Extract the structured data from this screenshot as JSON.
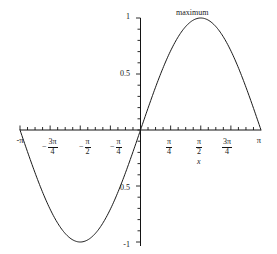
{
  "chart_data": {
    "type": "line",
    "title": "",
    "subtitle": "",
    "xlabel": "x",
    "ylabel": "",
    "function": "sin(x)",
    "xlim": [
      -3.14159265,
      3.14159265
    ],
    "ylim": [
      -1,
      1
    ],
    "grid": false,
    "legend": null,
    "x": [
      -3.14159265,
      -2.94524311,
      -2.74889357,
      -2.55254403,
      -2.35619449,
      -2.15984495,
      -1.96349541,
      -1.76714587,
      -1.57079633,
      -1.37444679,
      -1.17809725,
      -0.9817477,
      -0.78539816,
      -0.58904862,
      -0.39269908,
      -0.19634954,
      0,
      0.19634954,
      0.39269908,
      0.58904862,
      0.78539816,
      0.9817477,
      1.17809725,
      1.37444679,
      1.57079633,
      1.76714587,
      1.96349541,
      2.15984495,
      2.35619449,
      2.55254403,
      2.74889357,
      2.94524311,
      3.14159265
    ],
    "y": [
      0,
      -0.19509032,
      -0.38268343,
      -0.55557023,
      -0.70710678,
      -0.83146961,
      -0.92387953,
      -0.98078528,
      -1,
      -0.98078528,
      -0.92387953,
      -0.83146961,
      -0.70710678,
      -0.55557023,
      -0.38268343,
      -0.19509032,
      0,
      0.19509032,
      0.38268343,
      0.55557023,
      0.70710678,
      0.83146961,
      0.92387953,
      0.98078528,
      1,
      0.98078528,
      0.92387953,
      0.83146961,
      0.70710678,
      0.55557023,
      0.38268343,
      0.19509032,
      0
    ],
    "y_ticks": [
      {
        "value": 1,
        "label": "1"
      },
      {
        "value": 0.5,
        "label": "0.5"
      },
      {
        "value": -0.5,
        "label": "0.5"
      },
      {
        "value": -1,
        "label": "-1"
      }
    ],
    "x_ticks": [
      {
        "value": -3.14159265,
        "label": "-π",
        "kind": "plain",
        "sign": "-",
        "num": "",
        "den": ""
      },
      {
        "value": -2.35619449,
        "label": "-3π/4",
        "kind": "fraction",
        "sign": "-",
        "num": "3π",
        "den": "4"
      },
      {
        "value": -1.57079633,
        "label": "-π/2",
        "kind": "fraction",
        "sign": "-",
        "num": "π",
        "den": "2"
      },
      {
        "value": -0.78539816,
        "label": "-π/4",
        "kind": "fraction",
        "sign": "-",
        "num": "π",
        "den": "4"
      },
      {
        "value": 0.78539816,
        "label": "π/4",
        "kind": "fraction",
        "sign": "",
        "num": "π",
        "den": "4"
      },
      {
        "value": 1.57079633,
        "label": "π/2",
        "kind": "fraction",
        "sign": "",
        "num": "π",
        "den": "2"
      },
      {
        "value": 2.35619449,
        "label": "3π/4",
        "kind": "fraction",
        "sign": "",
        "num": "3π",
        "den": "4"
      },
      {
        "value": 3.14159265,
        "label": "π",
        "kind": "plain",
        "sign": "",
        "num": "",
        "den": ""
      }
    ],
    "annotations": [
      {
        "text": "maximum",
        "x": 1.57079633,
        "y": 1,
        "points_to": "peak"
      }
    ],
    "curve_color": "#1a1a1a",
    "axis_color": "#141414",
    "background_color": "#ffffff"
  },
  "labels": {
    "y_top": "1",
    "y_half": "0.5",
    "y_neg_half": "0.5",
    "y_neg_one": "-1",
    "x_neg_pi": "-π",
    "x_pi": "π",
    "x_axis_title": "x",
    "maximum_annotation": "maximum",
    "num_3pi": "3π",
    "num_pi": "π",
    "den_4": "4",
    "den_2": "2",
    "minus": "−"
  }
}
